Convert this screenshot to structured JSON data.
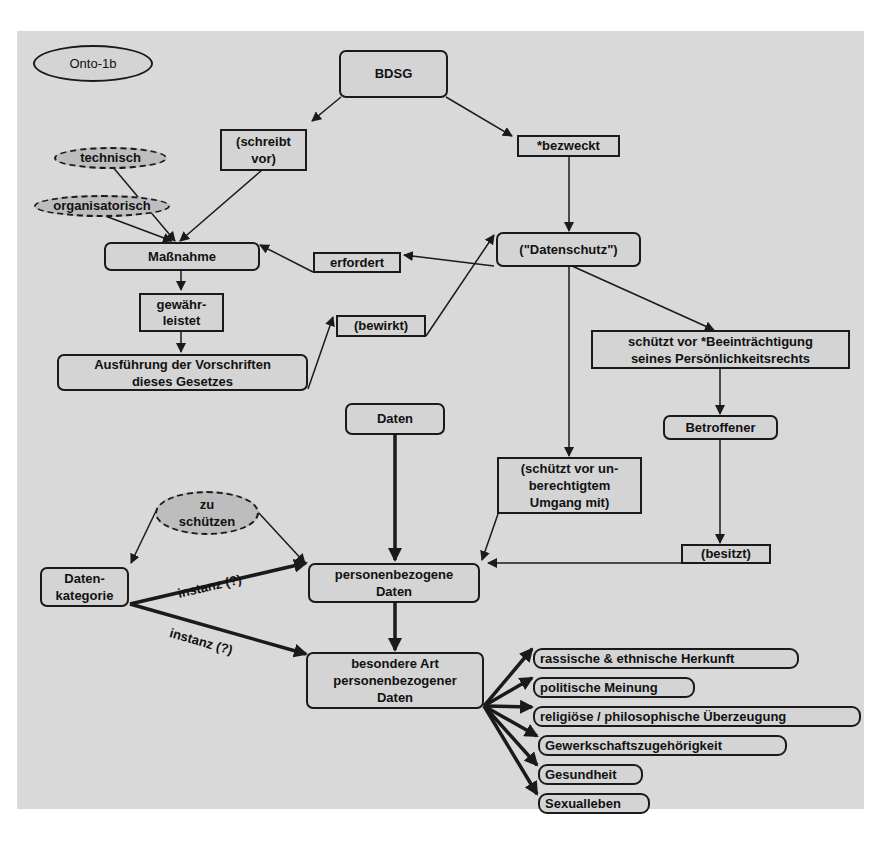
{
  "diagram": {
    "title": "Onto-1b",
    "nodes": {
      "bdsg": "BDSG",
      "schreibt_vor": "(schreibt\nvor)",
      "bezweckt": "*bezweckt",
      "technisch": "technisch",
      "organisatorisch": "organisatorisch",
      "massnahme": "Maßnahme",
      "erfordert": "erfordert",
      "datenschutz": "(\"Datenschutz\")",
      "gewaehrleistet": "gewähr-\nleistet",
      "bewirkt": "(bewirkt)",
      "ausfuehrung": "Ausführung der Vorschriften\ndieses Gesetzes",
      "schuetzt_vor_beeintraechtigung": "schützt vor *Beeinträchtigung\nseines Persönlichkeitsrechts",
      "betroffener": "Betroffener",
      "daten": "Daten",
      "schuetzt_vor_unberechtigtem": "(schützt vor un-\nberechtigtem\nUmgang mit)",
      "zu_schuetzen": "zu\nschützen",
      "besitzt": "(besitzt)",
      "datenkategorie": "Daten-\nkategorie",
      "personenbezogene_daten": "personenbezogene\nDaten",
      "besondere_art": "besondere Art\npersonenbezogener\nDaten"
    },
    "edge_labels": {
      "instanz_1": "instanz (?)",
      "instanz_2": "instanz (?)"
    },
    "special_categories": [
      "rassische & ethnische Herkunft",
      "politische Meinung",
      "religiöse / philosophische Überzeugung",
      "Gewerkschaftszugehörigkeit",
      "Gesundheit",
      "Sexualleben"
    ],
    "colors": {
      "background": "#d9d9d9",
      "node_fill": "#d4d4d4",
      "dashed_fill": "#bdbdbd",
      "stroke": "#1a1a1a"
    }
  }
}
